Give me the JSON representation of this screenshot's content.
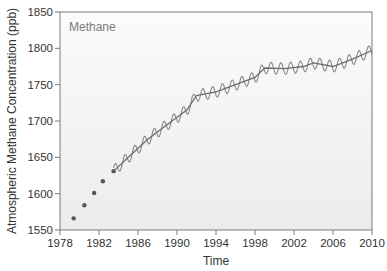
{
  "chart_data": {
    "type": "line",
    "title": "Methane",
    "xlabel": "Time",
    "ylabel": "Atmospheric Methane Concentration (ppb)",
    "xlim": [
      1978,
      2010
    ],
    "ylim": [
      1550,
      1850
    ],
    "x_ticks": [
      1978,
      1982,
      1986,
      1990,
      1994,
      1998,
      2002,
      2006,
      2010
    ],
    "y_ticks": [
      1550,
      1600,
      1650,
      1700,
      1750,
      1800,
      1850
    ],
    "grid": false,
    "legend": null,
    "series": [
      {
        "name": "Early measurements (points)",
        "style": "scatter",
        "x": [
          1979.4,
          1980.5,
          1981.5,
          1982.4,
          1983.5
        ],
        "y": [
          1566,
          1584,
          1601,
          1617,
          1631
        ]
      },
      {
        "name": "Trend (deseasonalized)",
        "style": "line",
        "x": [
          1983.5,
          1985,
          1987,
          1989,
          1991,
          1992,
          1994,
          1996,
          1998,
          1999,
          2001,
          2003,
          2004,
          2006,
          2008,
          2010
        ],
        "y": [
          1631,
          1650,
          1675,
          1695,
          1715,
          1735,
          1740,
          1750,
          1760,
          1773,
          1772,
          1775,
          1780,
          1775,
          1785,
          1797
        ]
      },
      {
        "name": "Monthly (seasonal cycle)",
        "style": "line",
        "note": "Oscillates about the trend with ~±8 ppb annual seasonal amplitude",
        "amplitude": 8
      }
    ]
  },
  "colors": {
    "axis": "#7a7a7a",
    "line": "#6e6e6e",
    "points": "#555555",
    "plot_bg_top": "#f7f7f7",
    "plot_bg_bottom": "#ebebeb"
  }
}
